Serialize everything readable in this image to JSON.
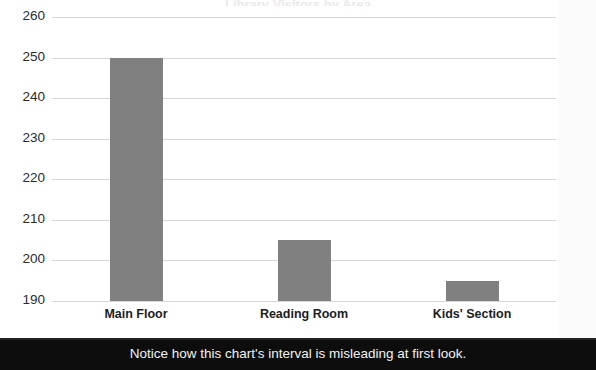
{
  "caption": {
    "text": "Notice how this chart's interval is misleading at first look."
  },
  "title_remnant": {
    "text": "Library Visitors by Area"
  },
  "chart_data": {
    "type": "bar",
    "title": "",
    "xlabel": "",
    "ylabel": "",
    "categories": [
      "Main Floor",
      "Reading Room",
      "Kids' Section"
    ],
    "values": [
      250,
      205,
      195
    ],
    "series": [
      {
        "name": "Visitors",
        "values": [
          250,
          205,
          195
        ],
        "color": "#808080"
      }
    ],
    "ylim": [
      190,
      260
    ],
    "ytick_step": 10,
    "yticks": [
      190,
      200,
      210,
      220,
      230,
      240,
      250,
      260
    ],
    "ytick_labels": [
      "190",
      "200",
      "210",
      "220",
      "230",
      "240",
      "250",
      "260"
    ],
    "grid": true,
    "grid_axis": "y",
    "grid_color": "#d6d6d6",
    "legend": false,
    "legend_position": "none",
    "bar_color": "#808080",
    "background": "#ffffff",
    "axis_truncated": true,
    "annotation": "Notice how this chart's interval is misleading at first look."
  },
  "colors": {
    "bar": "#808080",
    "grid": "#d6d6d6",
    "caption_background": "#0d0d0d",
    "caption_text": "#f2f2f2",
    "tick_text": "#2b2b2b",
    "category_text": "#1d1d1d",
    "panel_background": "#ffffff"
  }
}
